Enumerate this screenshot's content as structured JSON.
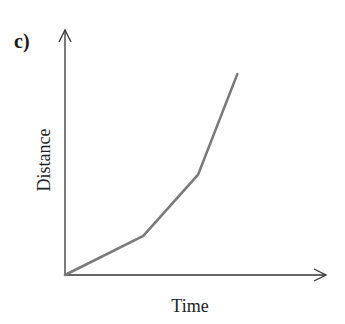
{
  "panel_label": "c)",
  "chart_data": {
    "type": "line",
    "title": "",
    "xlabel": "Time",
    "ylabel": "Distance",
    "x_ticks": [],
    "y_ticks": [],
    "grid": false,
    "legend": null,
    "series": [
      {
        "name": "distance-time",
        "color": "#7a7a7a",
        "points_normalized": [
          [
            0,
            0
          ],
          [
            0.3,
            0.16
          ],
          [
            0.51,
            0.41
          ],
          [
            0.66,
            0.82
          ]
        ]
      }
    ],
    "xlim": [
      0,
      1
    ],
    "ylim": [
      0,
      1
    ]
  }
}
